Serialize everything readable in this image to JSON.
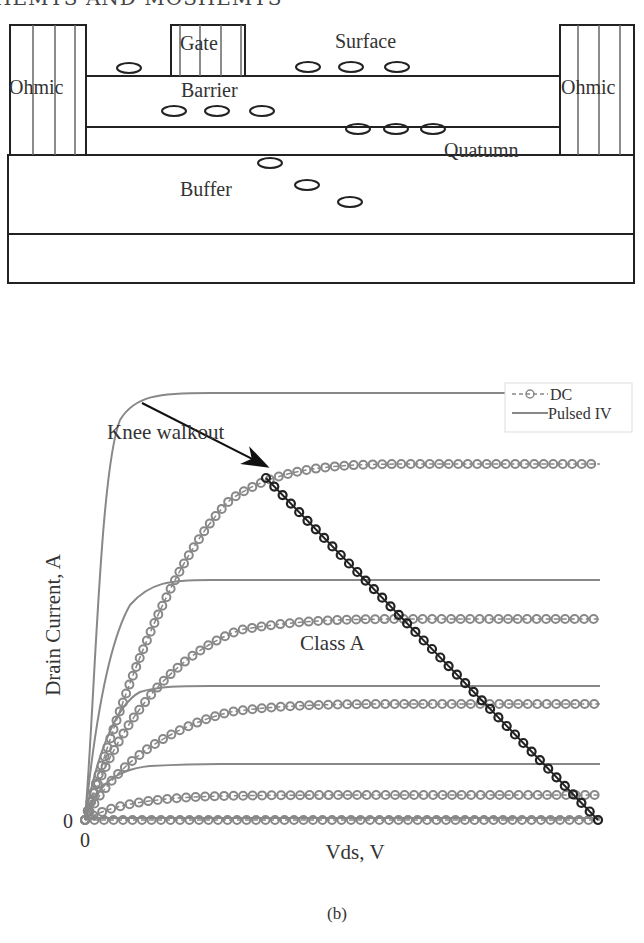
{
  "header": {
    "text": "HEMTS AND MOSHEMTS"
  },
  "figure_a": {
    "caption": "(a)",
    "labels": {
      "ohmic_left": "Ohmic",
      "ohmic_right": "Ohmic",
      "gate": "Gate",
      "surface": "Surface",
      "barrier": "Barrier",
      "quantum": "Quatumn",
      "buffer": "Buffer"
    },
    "layers": [
      "Surface",
      "Barrier",
      "Quatumn",
      "Buffer",
      "Substrate"
    ],
    "traps": {
      "surface": 4,
      "barrier": 3,
      "quantum": 3,
      "buffer": 3
    }
  },
  "figure_b": {
    "caption": "(b)",
    "annotation_knee": "Knee walkout",
    "annotation_class": "Class A",
    "x_origin_label": "0",
    "y_origin_label": "0",
    "legend": [
      {
        "label": "DC",
        "style": "dashed-circle-marker",
        "color": "#888888"
      },
      {
        "label": "Pulsed IV",
        "style": "solid",
        "color": "#888888"
      }
    ]
  },
  "chart_data": {
    "type": "line",
    "title": "",
    "xlabel": "Vds, V",
    "ylabel": "Drain Current, A",
    "x_ticks": [
      "0"
    ],
    "y_ticks": [
      "0"
    ],
    "grid": false,
    "legend_position": "upper right",
    "units": "normalized (0-1) — axes unlabeled except origin",
    "series": [
      {
        "name": "Pulsed IV (Vgs1)",
        "style": "solid",
        "saturation_current": 1.0,
        "knee_vds": 0.12
      },
      {
        "name": "Pulsed IV (Vgs2)",
        "style": "solid",
        "saturation_current": 0.56,
        "knee_vds": 0.1
      },
      {
        "name": "Pulsed IV (Vgs3)",
        "style": "solid",
        "saturation_current": 0.31,
        "knee_vds": 0.08
      },
      {
        "name": "Pulsed IV (Vgs4)",
        "style": "solid",
        "saturation_current": 0.12,
        "knee_vds": 0.07
      },
      {
        "name": "Pulsed IV (Vgs5)",
        "style": "solid",
        "saturation_current": 0.0,
        "knee_vds": 0.0
      },
      {
        "name": "DC (Vgs1)",
        "style": "dashed-circle",
        "saturation_current": 0.83,
        "knee_vds": 0.35
      },
      {
        "name": "DC (Vgs2)",
        "style": "dashed-circle",
        "saturation_current": 0.47,
        "knee_vds": 0.35
      },
      {
        "name": "DC (Vgs3)",
        "style": "dashed-circle",
        "saturation_current": 0.27,
        "knee_vds": 0.3
      },
      {
        "name": "DC (Vgs4)",
        "style": "dashed-circle",
        "saturation_current": 0.06,
        "knee_vds": 0.25
      },
      {
        "name": "DC (Vgs5)",
        "style": "dashed-circle",
        "saturation_current": 0.0,
        "knee_vds": 0.0
      },
      {
        "name": "Load line (Class A)",
        "style": "solid-dark-circle",
        "x": [
          0.35,
          1.0
        ],
        "y": [
          0.8,
          0.0
        ]
      }
    ],
    "annotations": [
      {
        "text": "Knee walkout",
        "arrow_to": [
          0.35,
          0.8
        ]
      },
      {
        "text": "Class A",
        "at": [
          0.45,
          0.4
        ]
      }
    ],
    "xlim": [
      0,
      1.0
    ],
    "ylim": [
      0,
      1.05
    ]
  }
}
